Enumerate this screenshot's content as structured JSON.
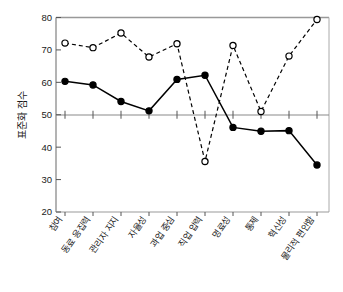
{
  "chart_data": {
    "type": "line",
    "title": "",
    "xlabel": "",
    "ylabel": "표준화 점수",
    "ylim": [
      20,
      80
    ],
    "yticks": [
      20,
      30,
      40,
      50,
      60,
      70,
      80
    ],
    "grid": false,
    "legend_position": "none",
    "categories": [
      "참여",
      "동료 응집력",
      "관리자 지지",
      "자율성",
      "과업 중심",
      "직업 압력",
      "명료성",
      "통제",
      "혁신성",
      "물리적 편안함"
    ],
    "series": [
      {
        "name": "series-solid-filled",
        "marker": "filled-circle",
        "line_style": "solid",
        "color": "#000000",
        "values": [
          60.3,
          59.2,
          54.1,
          51.2,
          60.9,
          62.2,
          46.1,
          44.9,
          45.1,
          34.5
        ]
      },
      {
        "name": "series-dashed-open",
        "marker": "open-circle",
        "line_style": "dashed",
        "color": "#000000",
        "values": [
          72.1,
          70.7,
          75.2,
          67.8,
          71.9,
          35.6,
          71.4,
          51.0,
          68.1,
          79.4
        ]
      }
    ],
    "axis": {
      "y_tick_labels": [
        "20",
        "30",
        "40",
        "50",
        "60",
        "70",
        "80"
      ],
      "baseline_value": 50,
      "frame": "box"
    }
  }
}
